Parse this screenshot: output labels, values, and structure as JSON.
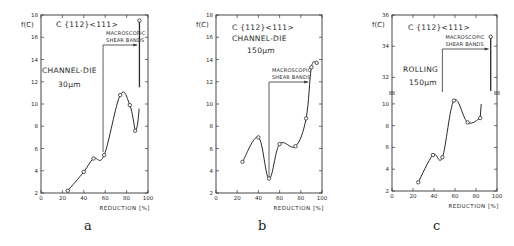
{
  "panels": [
    {
      "id": "a",
      "label": "a"
    },
    {
      "id": "b",
      "label": "b"
    },
    {
      "id": "c",
      "label": "c"
    }
  ],
  "chart_data": [
    {
      "type": "line",
      "panel": "a",
      "title": "C {112}<111>",
      "annotations": [
        "CHANNEL-DIE",
        "30µm",
        "MACROSCOPIC",
        "SHEAR BANDS"
      ],
      "xlabel": "REDUCTION [%]",
      "ylabel": "f(C)",
      "xlim": [
        0,
        100
      ],
      "ylim": [
        2,
        18
      ],
      "xticks": [
        0,
        20,
        40,
        60,
        80,
        100
      ],
      "yticks": [
        2,
        4,
        6,
        8,
        10,
        12,
        14,
        16,
        18
      ],
      "grid": false,
      "shear_band_start": 58,
      "x": [
        25,
        40,
        49,
        59,
        74,
        83,
        88,
        92
      ],
      "values": [
        2.2,
        3.9,
        5.1,
        5.4,
        10.8,
        9.9,
        7.6,
        17.5
      ]
    },
    {
      "type": "line",
      "panel": "b",
      "title": "C {112}<111>",
      "annotations": [
        "CHANNEL-DIE",
        "150µm",
        "MACROSCOPIC",
        "SHEAR BANDS"
      ],
      "xlabel": "REDUCTION [%]",
      "ylabel": "f(C)",
      "xlim": [
        0,
        100
      ],
      "ylim": [
        2,
        18
      ],
      "xticks": [
        0,
        20,
        40,
        60,
        80,
        100
      ],
      "yticks": [
        2,
        4,
        6,
        8,
        10,
        12,
        14,
        16,
        18
      ],
      "grid": false,
      "shear_band_start": 50,
      "x": [
        25,
        40,
        50,
        60,
        75,
        85,
        90,
        95
      ],
      "values": [
        4.8,
        7.0,
        3.3,
        6.4,
        6.2,
        8.7,
        13.3,
        13.7
      ]
    },
    {
      "type": "line",
      "panel": "c",
      "title": "C {112}<111>",
      "annotations": [
        "ROLLING",
        "150µm",
        "MACROSCOPIC",
        "SHEAR BANDS"
      ],
      "xlabel": "REDUCTION [%]",
      "ylabel": "f(C)",
      "xlim": [
        0,
        100
      ],
      "ylim": [
        2,
        36
      ],
      "axis_break": [
        11,
        31
      ],
      "xticks": [
        0,
        20,
        40,
        60,
        80,
        100
      ],
      "yticks": [
        2,
        4,
        6,
        8,
        10,
        32,
        34,
        36
      ],
      "grid": false,
      "shear_band_start": 48,
      "x": [
        25,
        39,
        48,
        59,
        72,
        84,
        94
      ],
      "values": [
        2.8,
        5.3,
        5.1,
        10.3,
        8.3,
        8.7,
        34.6
      ]
    }
  ]
}
